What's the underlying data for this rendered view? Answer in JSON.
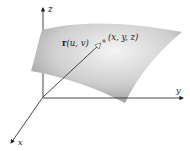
{
  "diagram": {
    "type": "parametric-surface",
    "axes": {
      "z_label": "z",
      "y_label": "y",
      "x_label": "x"
    },
    "point_label": "(x, y, z)",
    "vector_label_bold": "r",
    "vector_label_args": "(u, v)",
    "colors": {
      "surface_light": "#f2f2f2",
      "surface_dark": "#9a9a9a",
      "axis": "#333333",
      "point": "#888888"
    }
  }
}
